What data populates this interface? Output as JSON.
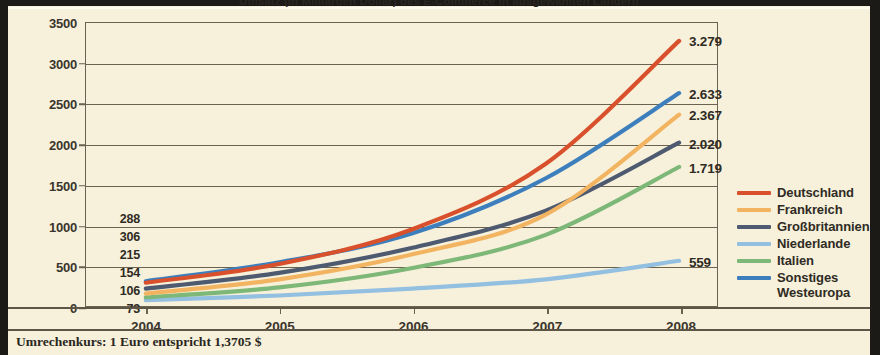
{
  "title": "Umsatz (in Milliarden Dollar) des E-Commerce in ausgewählten Ländern",
  "footnote": "Umrechenkurs: 1 Euro entspricht 1,3705 $",
  "chart_data": {
    "type": "line",
    "title": "Umsatz (in Milliarden Dollar) des E-Commerce in ausgewählten Ländern",
    "xlabel": "",
    "ylabel": "",
    "ylim": [
      0,
      3500
    ],
    "yticks": [
      0,
      500,
      1000,
      1500,
      2000,
      2500,
      3000,
      3500
    ],
    "ytick_labels": [
      "0",
      "500",
      "1000",
      "1500",
      "2000",
      "2500",
      "3000",
      "3500"
    ],
    "grid": true,
    "legend_position": "right",
    "categories": [
      "2004",
      "2005",
      "2006",
      "2007",
      "2008"
    ],
    "x": [
      2004,
      2005,
      2006,
      2007,
      2008
    ],
    "series": [
      {
        "name": "Deutschland",
        "color": "#d9502c",
        "values": [
          288,
          520,
          950,
          1760,
          3279
        ],
        "start_label": "288",
        "end_label": "3.279"
      },
      {
        "name": "Frankreich",
        "color": "#f2b461",
        "values": [
          154,
          330,
          640,
          1130,
          2367
        ],
        "start_label": "154",
        "end_label": "2.367"
      },
      {
        "name": "Großbritannien",
        "color": "#4d5a70",
        "values": [
          215,
          410,
          720,
          1180,
          2020
        ],
        "start_label": "215",
        "end_label": "2.020"
      },
      {
        "name": "Niederlande",
        "color": "#93bfe0",
        "values": [
          73,
          130,
          215,
          330,
          559
        ],
        "start_label": "73",
        "end_label": "559"
      },
      {
        "name": "Italien",
        "color": "#7eb878",
        "values": [
          106,
          230,
          470,
          880,
          1719
        ],
        "start_label": "106",
        "end_label": "1.719"
      },
      {
        "name": "Sonstiges\nWesteuropa",
        "color": "#3d7fbd",
        "values": [
          306,
          540,
          900,
          1580,
          2633
        ],
        "start_label": "306",
        "end_label": "2.633"
      }
    ]
  }
}
